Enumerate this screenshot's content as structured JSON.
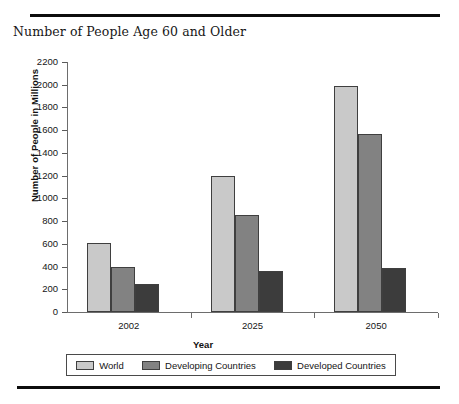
{
  "figure": {
    "title": "Number of People Age 60 and Older",
    "rule_top": "horizontal-rule",
    "rule_bottom": "horizontal-rule"
  },
  "chart_data": {
    "type": "bar",
    "title": "Number of People Age 60 and Older",
    "xlabel": "Year",
    "ylabel": "Number of People in Millions",
    "categories": [
      "2002",
      "2025",
      "2050"
    ],
    "series": [
      {
        "name": "World",
        "color": "#c9c9c9",
        "values": [
          610,
          1200,
          1990
        ]
      },
      {
        "name": "Developing Countries",
        "color": "#828282",
        "values": [
          400,
          850,
          1570
        ]
      },
      {
        "name": "Developed Countries",
        "color": "#3c3c3c",
        "values": [
          250,
          360,
          390
        ]
      }
    ],
    "ylim": [
      0,
      2200
    ],
    "ytick_step": 200,
    "yticks": [
      "2200",
      "2000",
      "1800",
      "1600",
      "1400",
      "1200",
      "1000",
      "800",
      "600",
      "400",
      "200",
      "0"
    ],
    "grid": false,
    "legend_position": "bottom"
  }
}
